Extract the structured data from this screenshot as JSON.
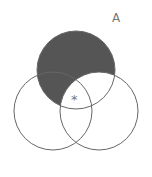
{
  "diagram": {
    "type": "venn-3",
    "label_a": "A",
    "marker": "*",
    "colors": {
      "shade": "#555555",
      "stroke": "#666666",
      "text": "#777777",
      "background": "#ffffff"
    },
    "circles": [
      {
        "name": "A",
        "cx": 76,
        "cy": 70,
        "r": 39
      },
      {
        "name": "B",
        "cx": 53,
        "cy": 111,
        "r": 39
      },
      {
        "name": "C",
        "cx": 99,
        "cy": 111,
        "r": 39
      }
    ],
    "shaded_region": "A minus C"
  }
}
